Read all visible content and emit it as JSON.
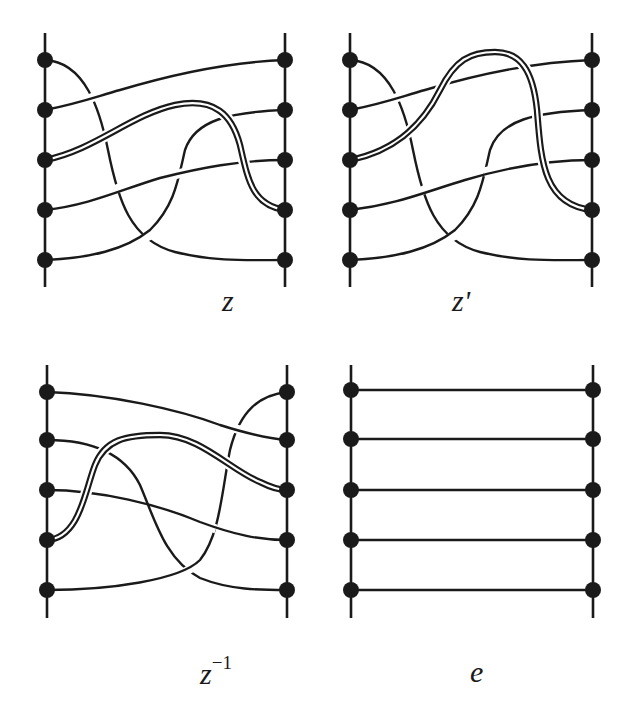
{
  "figure": {
    "panels": [
      {
        "id": "z",
        "label": "z",
        "label_sup": "",
        "description": "braid z: 5 strands with one highlighted (double-line) strand going from left position 3 to right position 4"
      },
      {
        "id": "z-prime",
        "label": "z'",
        "label_sup": "",
        "description": "braid z': variant of z where the highlighted strand passes over the top strand"
      },
      {
        "id": "z-inverse",
        "label": "z",
        "label_sup": "−1",
        "description": "braid z inverse: mirror of z with highlighted strand from left position 4 to right position 3"
      },
      {
        "id": "e",
        "label": "e",
        "label_sup": "",
        "description": "identity braid: 5 straight horizontal strands"
      }
    ],
    "strand_count": 5,
    "colors": {
      "ink": "#1a1a1a",
      "background": "#ffffff"
    }
  }
}
